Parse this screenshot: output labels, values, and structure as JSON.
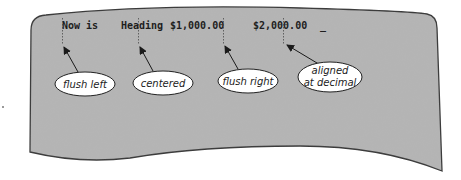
{
  "figure": {
    "type": "text-alignment-diagram",
    "colors": {
      "sheet_fill": "#b4b4b4",
      "sheet_outline": "#3a3a3a",
      "ellipse_fill": "#ffffff",
      "text": "#1e1e1e"
    },
    "screen_row": {
      "items": [
        {
          "text": "Now is",
          "alignment": "flush left"
        },
        {
          "text": "Heading",
          "alignment": "centered"
        },
        {
          "text": "$1,000.00",
          "alignment": "flush right"
        },
        {
          "text": "$2,000.00",
          "alignment": "aligned at decimal"
        }
      ],
      "cursor": "_"
    },
    "callouts": [
      {
        "label": "flush left"
      },
      {
        "label": "centered"
      },
      {
        "label": "flush right"
      },
      {
        "label_line1": "aligned",
        "label_line2": "at decimal"
      }
    ]
  }
}
